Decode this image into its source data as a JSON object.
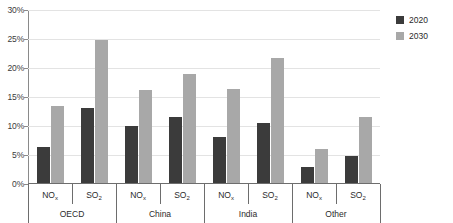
{
  "chart_data": {
    "type": "bar",
    "title": "",
    "subtitle": "",
    "xlabel": "",
    "ylabel": "",
    "ylim": [
      0,
      30
    ],
    "ytick_labels": [
      "0%",
      "5%",
      "10%",
      "15%",
      "20%",
      "25%",
      "30%"
    ],
    "ytick_values": [
      0,
      5,
      10,
      15,
      20,
      25,
      30
    ],
    "grid": true,
    "legend_position": "right",
    "value_unit": "%",
    "groups": [
      "OECD",
      "China",
      "India",
      "Other"
    ],
    "categories": [
      "NOx",
      "SO2",
      "NOx",
      "SO2",
      "NOx",
      "SO2",
      "NOx",
      "SO2"
    ],
    "category_labels": [
      {
        "base": "NO",
        "sub": "x"
      },
      {
        "base": "SO",
        "sub": "2"
      },
      {
        "base": "NO",
        "sub": "x"
      },
      {
        "base": "SO",
        "sub": "2"
      },
      {
        "base": "NO",
        "sub": "x"
      },
      {
        "base": "SO",
        "sub": "2"
      },
      {
        "base": "NO",
        "sub": "x"
      },
      {
        "base": "SO",
        "sub": "2"
      }
    ],
    "series": [
      {
        "name": "2020",
        "color": "#3b3b3b",
        "values": [
          6.3,
          13.1,
          10.0,
          11.6,
          8.1,
          10.5,
          3.0,
          4.9
        ]
      },
      {
        "name": "2030",
        "color": "#a8a8a8",
        "values": [
          13.4,
          24.9,
          16.2,
          19.0,
          16.3,
          21.7,
          6.0,
          11.5
        ]
      }
    ]
  },
  "legend": {
    "entries": [
      {
        "label": "2020",
        "color": "#3b3b3b"
      },
      {
        "label": "2030",
        "color": "#a8a8a8"
      }
    ]
  },
  "axis": {
    "y": {
      "ticks": [
        {
          "label": "30%",
          "value": 30
        },
        {
          "label": "25%",
          "value": 25
        },
        {
          "label": "20%",
          "value": 20
        },
        {
          "label": "15%",
          "value": 15
        },
        {
          "label": "10%",
          "value": 10
        },
        {
          "label": "5%",
          "value": 5
        },
        {
          "label": "0%",
          "value": 0
        }
      ]
    }
  },
  "colors": {
    "series_2020": "#3b3b3b",
    "series_2030": "#a8a8a8",
    "gridline": "#e3e3e3",
    "axis": "#6d6d6d",
    "text": "#2b2b2b",
    "background": "#ffffff"
  }
}
